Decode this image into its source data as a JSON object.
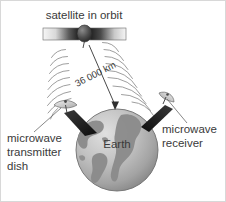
{
  "diagram": {
    "title_label": "satellite in orbit",
    "earth_label": "Earth",
    "distance_label": "36 000 km",
    "transmitter_label_line1": "microwave",
    "transmitter_label_line2": "transmitter",
    "transmitter_label_line3": "dish",
    "receiver_label_line1": "microwave",
    "receiver_label_line2": "receiver",
    "colors": {
      "text": "#3a3a3a",
      "outline": "#5a5a5a",
      "wave": "#8d8d8d",
      "earth_ocean_light": "#cfcfcf",
      "earth_ocean_dark": "#9a9a9a",
      "earth_land": "#8a8a8a",
      "panel_light": "#f2f2f2",
      "panel_dark": "#2b2b2b",
      "mount_dark": "#262626",
      "background": "#ffffff",
      "border": "#d8d8d8"
    }
  }
}
